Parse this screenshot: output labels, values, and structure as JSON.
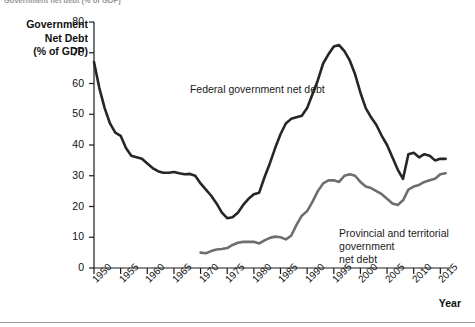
{
  "figure": {
    "clipped_top_caption": "Government net debt (% of GDP)",
    "background_color": "#ffffff"
  },
  "chart_data": {
    "type": "line",
    "title": "",
    "xlabel": "Year",
    "ylabel": "Government\nNet Debt\n(% of GDP)",
    "ylabel_lines": [
      "Government",
      "Net Debt",
      "(% of GDP)"
    ],
    "xlim": [
      1950,
      2017
    ],
    "ylim": [
      0,
      80
    ],
    "grid": false,
    "legend_position": "inline-annotations",
    "ytick_labels": [
      "0",
      "10",
      "20",
      "30",
      "40",
      "50",
      "60",
      "70",
      "80"
    ],
    "ytick_values": [
      0,
      10,
      20,
      30,
      40,
      50,
      60,
      70,
      80
    ],
    "xtick_labels": [
      "1950",
      "1955",
      "1960",
      "1965",
      "1970",
      "1975",
      "1980",
      "1985",
      "1990",
      "1995",
      "2000",
      "2005",
      "2010",
      "2015"
    ],
    "xtick_values": [
      1950,
      1955,
      1960,
      1965,
      1970,
      1975,
      1980,
      1985,
      1990,
      1995,
      2000,
      2005,
      2010,
      2015
    ],
    "annotations": [
      {
        "text": "Federal government net debt",
        "x": 1968,
        "y": 58
      },
      {
        "text": "Provincial and territorial government\nnet debt",
        "x": 1996,
        "y": 11
      }
    ],
    "series": [
      {
        "name": "Federal government net debt",
        "color": "#262626",
        "width": 2.6,
        "x": [
          1950,
          1951,
          1952,
          1953,
          1954,
          1955,
          1956,
          1957,
          1958,
          1959,
          1960,
          1961,
          1962,
          1963,
          1964,
          1965,
          1966,
          1967,
          1968,
          1969,
          1970,
          1971,
          1972,
          1973,
          1974,
          1975,
          1976,
          1977,
          1978,
          1979,
          1980,
          1981,
          1982,
          1983,
          1984,
          1985,
          1986,
          1987,
          1988,
          1989,
          1990,
          1991,
          1992,
          1993,
          1994,
          1995,
          1996,
          1997,
          1998,
          1999,
          2000,
          2001,
          2002,
          2003,
          2004,
          2005,
          2006,
          2007,
          2008,
          2009,
          2010,
          2011,
          2012,
          2013,
          2014,
          2015,
          2016
        ],
        "values": [
          67.0,
          58.5,
          52.0,
          47.0,
          44.0,
          43.0,
          39.0,
          36.5,
          36.0,
          35.5,
          34.0,
          32.5,
          31.5,
          31.0,
          31.0,
          31.2,
          30.8,
          30.5,
          30.6,
          30.0,
          27.5,
          25.5,
          23.5,
          21.0,
          18.0,
          16.2,
          16.5,
          18.0,
          20.5,
          22.5,
          24.0,
          24.5,
          29.5,
          34.0,
          39.0,
          43.5,
          47.0,
          48.5,
          49.0,
          49.5,
          52.0,
          56.5,
          61.0,
          66.5,
          69.5,
          72.0,
          72.5,
          70.5,
          67.5,
          63.0,
          57.0,
          52.0,
          49.0,
          46.5,
          43.0,
          40.0,
          36.0,
          32.0,
          29.0,
          37.0,
          37.5,
          36.0,
          37.0,
          36.5,
          35.0,
          35.5,
          35.5
        ]
      },
      {
        "name": "Provincial and territorial government net debt",
        "color": "#6e6e6e",
        "width": 2.6,
        "x": [
          1970,
          1971,
          1972,
          1973,
          1974,
          1975,
          1976,
          1977,
          1978,
          1979,
          1980,
          1981,
          1982,
          1983,
          1984,
          1985,
          1986,
          1987,
          1988,
          1989,
          1990,
          1991,
          1992,
          1993,
          1994,
          1995,
          1996,
          1997,
          1998,
          1999,
          2000,
          2001,
          2002,
          2003,
          2004,
          2005,
          2006,
          2007,
          2008,
          2009,
          2010,
          2011,
          2012,
          2013,
          2014,
          2015,
          2016
        ],
        "values": [
          5.0,
          4.8,
          5.5,
          6.0,
          6.2,
          6.5,
          7.5,
          8.2,
          8.5,
          8.5,
          8.5,
          8.0,
          9.0,
          9.8,
          10.2,
          10.0,
          9.3,
          10.5,
          14.0,
          17.0,
          18.5,
          21.5,
          25.0,
          27.5,
          28.5,
          28.5,
          28.0,
          30.0,
          30.5,
          30.0,
          28.0,
          26.5,
          26.0,
          25.0,
          24.0,
          22.5,
          21.0,
          20.5,
          22.0,
          25.5,
          26.5,
          27.0,
          28.0,
          28.5,
          29.0,
          30.5,
          30.8
        ]
      }
    ]
  }
}
